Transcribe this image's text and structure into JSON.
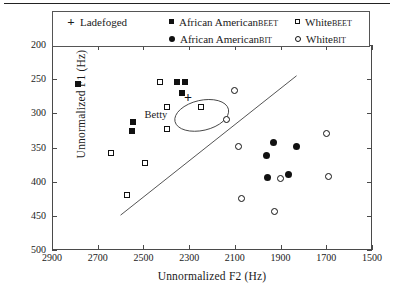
{
  "chart_data": {
    "type": "scatter",
    "title": "",
    "xlabel": "Unnormalized F2  (Hz)",
    "ylabel": "Unnormalized F1  (Hz)",
    "xlim": [
      2900,
      1500
    ],
    "ylim": [
      500,
      200
    ],
    "x_ticks": [
      2900,
      2700,
      2500,
      2300,
      2100,
      1900,
      1700,
      1500
    ],
    "y_ticks": [
      200,
      250,
      300,
      350,
      400,
      450,
      500
    ],
    "grid": false,
    "legend_position": "top",
    "axis_reversed": {
      "x": true,
      "y": true
    },
    "legend": [
      {
        "label": "Ladefoged",
        "marker": "plus"
      },
      {
        "label": "African American ",
        "small_caps": "beet",
        "marker": "filled-square"
      },
      {
        "label": "African American ",
        "small_caps": "bit",
        "marker": "filled-circle"
      },
      {
        "label": "White ",
        "small_caps": "beet",
        "marker": "open-square"
      },
      {
        "label": "White ",
        "small_caps": "bit",
        "marker": "open-circle"
      }
    ],
    "series": [
      {
        "name": "Ladefoged",
        "marker": "plus",
        "points": [
          {
            "f2": 2305,
            "f1": 278
          }
        ]
      },
      {
        "name": "African American BEET",
        "marker": "filled-square",
        "points": [
          {
            "f2": 2786,
            "f1": 257
          },
          {
            "f2": 2352,
            "f1": 254
          },
          {
            "f2": 2317,
            "f1": 254
          },
          {
            "f2": 2330,
            "f1": 270
          },
          {
            "f2": 2545,
            "f1": 313
          },
          {
            "f2": 2550,
            "f1": 326
          }
        ]
      },
      {
        "name": "African American BIT",
        "marker": "filled-circle",
        "points": [
          {
            "f2": 1961,
            "f1": 362
          },
          {
            "f2": 1930,
            "f1": 343
          },
          {
            "f2": 1957,
            "f1": 394
          },
          {
            "f2": 1830,
            "f1": 348
          },
          {
            "f2": 1866,
            "f1": 390
          }
        ]
      },
      {
        "name": "White BEET",
        "marker": "open-square",
        "points": [
          {
            "f2": 2427,
            "f1": 254
          },
          {
            "f2": 2396,
            "f1": 291
          },
          {
            "f2": 2396,
            "f1": 323
          },
          {
            "f2": 2248,
            "f1": 290
          },
          {
            "f2": 2642,
            "f1": 358
          },
          {
            "f2": 2492,
            "f1": 372
          },
          {
            "f2": 2570,
            "f1": 420
          }
        ]
      },
      {
        "name": "White BIT",
        "marker": "open-circle",
        "points": [
          {
            "f2": 2138,
            "f1": 309
          },
          {
            "f2": 2100,
            "f1": 267
          },
          {
            "f2": 2085,
            "f1": 348
          },
          {
            "f2": 1697,
            "f1": 330
          },
          {
            "f2": 1689,
            "f1": 392
          },
          {
            "f2": 1900,
            "f1": 395
          },
          {
            "f2": 2070,
            "f1": 425
          },
          {
            "f2": 1926,
            "f1": 443
          }
        ]
      }
    ],
    "annotations": [
      {
        "type": "text",
        "text": "Betty",
        "f2": 2495,
        "f1": 304
      },
      {
        "type": "ellipse",
        "center_f2": 2245,
        "center_f1": 303,
        "rx_hz": 120,
        "ry_hz": 22,
        "rotation_deg": -13
      },
      {
        "type": "line",
        "from": {
          "f2": 2600,
          "f1": 449
        },
        "to": {
          "f2": 1830,
          "f1": 245
        }
      }
    ]
  }
}
